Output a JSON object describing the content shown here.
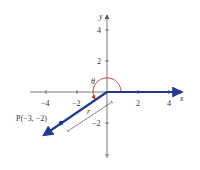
{
  "diagram": {
    "type": "coordinate-plane-angle",
    "axes": {
      "x_label": "x",
      "y_label": "y",
      "x_ticks": [
        {
          "value": -4,
          "label": "−4"
        },
        {
          "value": -2,
          "label": "−2"
        },
        {
          "value": 2,
          "label": "2"
        },
        {
          "value": 4,
          "label": "4"
        }
      ],
      "y_ticks": [
        {
          "value": 4,
          "label": "4"
        },
        {
          "value": 2,
          "label": "2"
        },
        {
          "value": -2,
          "label": "−2"
        },
        {
          "value": -4,
          "label": ""
        }
      ]
    },
    "angle_label": "θ",
    "radius_label": "r",
    "point": {
      "x": -3,
      "y": -2,
      "label": "P(−3, −2)"
    },
    "colors": {
      "ray": "#1f3a93",
      "arc": "#c0392b",
      "axis": "#555555"
    }
  }
}
